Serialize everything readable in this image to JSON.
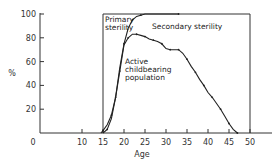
{
  "chart_data": {
    "type": "line",
    "title": "",
    "xlabel": "Age",
    "ylabel": "%",
    "xlim": [
      0,
      50
    ],
    "ylim": [
      0,
      100
    ],
    "x_ticks": [
      0,
      10,
      15,
      20,
      25,
      30,
      35,
      40,
      45,
      50
    ],
    "y_ticks": [
      20,
      40,
      60,
      80,
      100
    ],
    "grid": false,
    "annotations": [
      "Primary sterility",
      "Secondary sterility",
      "Active childbearing population"
    ],
    "series": [
      {
        "name": "Cumulative ever-married / exposed (upper curve)",
        "x": [
          15,
          16,
          17,
          18,
          19,
          20,
          21,
          22,
          23,
          24,
          25,
          33
        ],
        "y": [
          0,
          3,
          12,
          30,
          55,
          75,
          88,
          95,
          98,
          99,
          100,
          100
        ]
      },
      {
        "name": "Active childbearing population",
        "x": [
          14.5,
          15,
          16,
          17,
          18,
          19,
          20,
          21,
          22,
          23,
          24,
          25,
          26,
          27,
          28,
          29,
          30,
          31,
          32,
          33,
          34,
          35,
          36,
          37,
          38,
          39,
          40,
          41,
          42,
          43,
          44,
          45,
          46,
          47
        ],
        "y": [
          0,
          2,
          7,
          15,
          30,
          52,
          74,
          80,
          83,
          83,
          82,
          81,
          79,
          78,
          77,
          75,
          71,
          70,
          70,
          70,
          67,
          62,
          56,
          51,
          45,
          40,
          34,
          30,
          25,
          20,
          14,
          8,
          3,
          0
        ]
      }
    ],
    "boundaries": {
      "primary_sterility_line_age": 15,
      "secondary_sterility_top": 100,
      "right_boundary_age": 50
    }
  },
  "labels": {
    "xlabel": "Age",
    "ylabel": "%",
    "primary_1": "Primary",
    "primary_2": "sterility",
    "secondary": "Secondary sterility",
    "active_1": "Active",
    "active_2": "childbearing",
    "active_3": "population"
  }
}
